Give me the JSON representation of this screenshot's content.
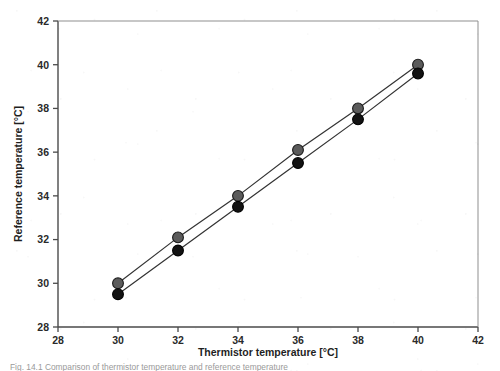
{
  "figure": {
    "background_color": "#ffffff",
    "frame_color": "#555555",
    "caption_partial": "Fig. 14.1  Comparison of thermistor temperature and reference temperature"
  },
  "chart_data": {
    "type": "line",
    "title": "",
    "subtitle": "",
    "xlabel": "Thermistor temperature [°C]",
    "ylabel": "Reference temperature [°C]",
    "xlim": [
      28,
      42
    ],
    "ylim": [
      28,
      42
    ],
    "xticks": [
      28,
      30,
      32,
      34,
      36,
      38,
      40,
      42
    ],
    "yticks": [
      28,
      30,
      32,
      34,
      36,
      38,
      40,
      42
    ],
    "xtick_labels": [
      "28",
      "30",
      "32",
      "34",
      "36",
      "38",
      "40",
      "42"
    ],
    "ytick_labels": [
      "28",
      "30",
      "32",
      "34",
      "36",
      "38",
      "40",
      "42"
    ],
    "grid": false,
    "legend": false,
    "legend_position": "none",
    "x": [
      30,
      32,
      34,
      36,
      38,
      40
    ],
    "series": [
      {
        "name": "Sensor 1",
        "marker": "circle",
        "marker_color": "#5b5b5b",
        "marker_edge_color": "#1a1a1a",
        "line_color": "#333333",
        "values": [
          30.0,
          32.1,
          34.0,
          36.1,
          38.0,
          40.0
        ]
      },
      {
        "name": "Sensor 2",
        "marker": "circle",
        "marker_color": "#121212",
        "marker_edge_color": "#000000",
        "line_color": "#333333",
        "values": [
          29.5,
          31.5,
          33.5,
          35.5,
          37.5,
          39.6
        ]
      }
    ]
  }
}
